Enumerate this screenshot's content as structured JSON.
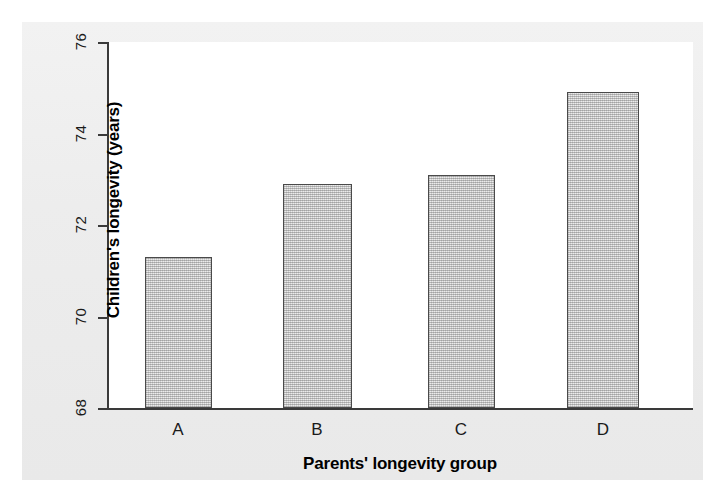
{
  "chart_data": {
    "type": "bar",
    "title": "",
    "subtitle": "",
    "categories": [
      "A",
      "B",
      "C",
      "D"
    ],
    "values": [
      71.3,
      72.9,
      73.1,
      74.9
    ],
    "series": [
      {
        "name": "Children's longevity",
        "values": [
          71.3,
          72.9,
          73.1,
          74.9
        ]
      }
    ],
    "xlabel": "Parents' longevity group",
    "ylabel": "Children's longevity (years)",
    "ylim": [
      68,
      76
    ],
    "yticks": [
      68,
      70,
      72,
      74,
      76
    ],
    "ytick_labels": [
      "68",
      "70",
      "72",
      "74",
      "76"
    ],
    "grid": false,
    "legend": false,
    "legend_position": "none",
    "annotations": [],
    "bar_fill_color": "#cccccc",
    "bar_edge_color": "#4a4a4a",
    "plot_background": "#ffffff",
    "figure_background": "#efefef",
    "axis_color": "#3a3a3a",
    "text_color": "#1a1a1a"
  }
}
